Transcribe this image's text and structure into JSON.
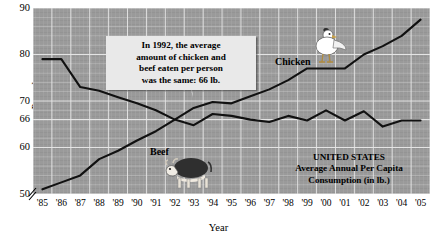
{
  "chart_data": {
    "type": "line",
    "title": "",
    "xlabel": "Year",
    "ylabel": "Pounds",
    "x": [
      "'85",
      "'86",
      "'87",
      "'88",
      "'89",
      "'90",
      "'91",
      "'92",
      "'93",
      "'94",
      "'95",
      "'96",
      "'97",
      "'98",
      "'99",
      "'00",
      "'01",
      "'02",
      "'03",
      "'04",
      "'05"
    ],
    "ylim": [
      50,
      90
    ],
    "yticks": [
      50,
      60,
      66,
      70,
      80,
      90
    ],
    "ytick_labels": [
      "50",
      "60",
      "66",
      "70",
      "80",
      "90"
    ],
    "axis_break": true,
    "grid": true,
    "legend": "inline-labels",
    "series": [
      {
        "name": "Beef",
        "values": [
          79,
          79,
          73,
          72.2,
          70.8,
          69.5,
          68,
          66,
          64.8,
          67.2,
          66.8,
          66,
          65.5,
          66.8,
          65.8,
          68,
          65.8,
          67.8,
          64.5,
          65.8,
          65.8
        ]
      },
      {
        "name": "Chicken",
        "values": [
          51,
          52.5,
          54,
          57.5,
          59.3,
          61.5,
          63.5,
          66,
          68.5,
          69.8,
          69.5,
          71,
          72.5,
          74.5,
          77,
          77,
          77,
          80,
          81.8,
          84,
          87.5
        ]
      }
    ],
    "annotations": [
      {
        "name": "callout",
        "text": "In 1992, the average amount of chicken and beef eaten per person was the same: 66 lb.",
        "lines": [
          "In 1992, the average",
          "amount of chicken and",
          "beef eaten per person",
          "was the same: 66 lb."
        ],
        "points_to_year": "'92",
        "points_to_value": 66
      },
      {
        "name": "source-note",
        "lines": [
          "UNITED STATES",
          "Average Annual Per Capita",
          "Consumption (in lb.)"
        ]
      }
    ],
    "colors": {
      "plot_background": "#9a9a9a",
      "gridline": "#e8e8e8",
      "line": "#111111",
      "callout_background": "#e9e9e9",
      "page_background": "#ffffff",
      "text": "#000000"
    },
    "icons": [
      {
        "name": "chicken-icon",
        "label": "Chicken"
      },
      {
        "name": "cow-icon",
        "label": "Beef"
      }
    ]
  }
}
